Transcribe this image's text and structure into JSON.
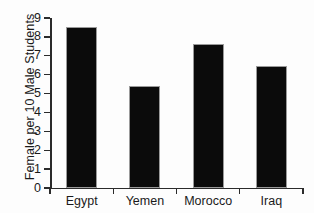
{
  "chart_data": {
    "type": "bar",
    "title": "",
    "xlabel": "",
    "ylabel": "Female per 10 Male Students",
    "categories": [
      "Egypt",
      "Yemen",
      "Morocco",
      "Iraq"
    ],
    "values": [
      8.5,
      5.4,
      7.6,
      6.45
    ],
    "ylim": [
      0,
      9
    ],
    "ytick_labels": [
      "0",
      "1",
      "2",
      "3",
      "4",
      "5",
      "6",
      "7",
      "8",
      "9"
    ],
    "ytick_values": [
      0,
      1,
      2,
      3,
      4,
      5,
      6,
      7,
      8,
      9
    ],
    "grid": false,
    "legend": false,
    "series": [
      {
        "name": "Female per 10 Male Students",
        "values": [
          8.5,
          5.4,
          7.6,
          6.45
        ],
        "color": "#0b0b0b"
      }
    ],
    "colors": {
      "bar_fill": "#0b0b0b",
      "bar_border": "#9a9a9a",
      "axis": "#2b2b2b",
      "text": "#1a1a1a",
      "background": "#fdfdfd"
    }
  }
}
